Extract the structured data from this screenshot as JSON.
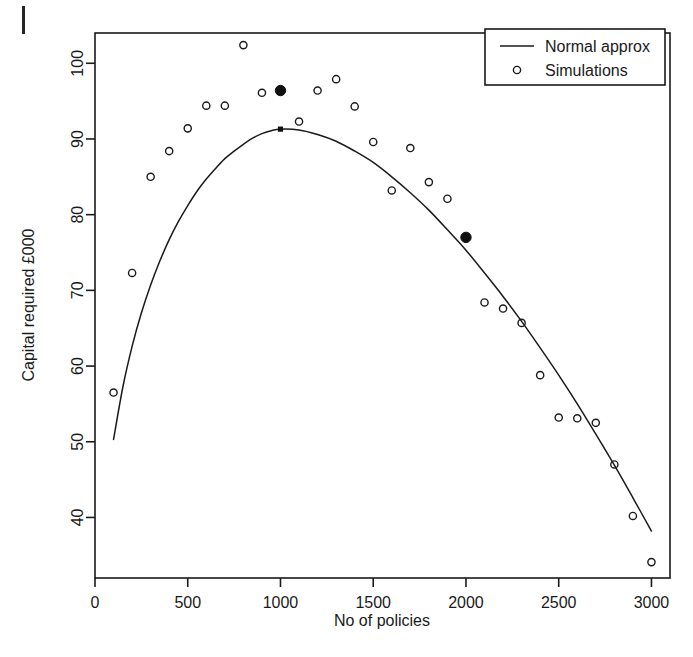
{
  "figure": {
    "background_color": "#ffffff",
    "ink_color": "#1a1a1a",
    "scan_artifact": "vertical-bar-top-left"
  },
  "chart_data": {
    "type": "scatter",
    "title": "",
    "xlabel": "No of policies",
    "ylabel": "Capital required £000",
    "xlim": [
      0,
      3100
    ],
    "ylim": [
      32,
      104
    ],
    "xticks": [
      0,
      500,
      1000,
      1500,
      2000,
      2500,
      3000
    ],
    "xtick_labels": [
      "0",
      "500",
      "1000",
      "1500",
      "2000",
      "2500",
      "3000"
    ],
    "yticks": [
      40,
      50,
      60,
      70,
      80,
      90,
      100
    ],
    "ytick_labels": [
      "40",
      "50",
      "60",
      "70",
      "80",
      "90",
      "100"
    ],
    "grid": false,
    "legend_position": "top-right",
    "legend": [
      {
        "label": "Normal approx",
        "marker": "line"
      },
      {
        "label": "Simulations",
        "marker": "open-circle"
      }
    ],
    "series": [
      {
        "name": "Normal approx",
        "style": "line",
        "x": [
          100,
          150,
          200,
          250,
          300,
          350,
          400,
          450,
          500,
          550,
          600,
          650,
          700,
          750,
          800,
          850,
          900,
          950,
          1000,
          1100,
          1200,
          1300,
          1400,
          1500,
          1600,
          1700,
          1800,
          1900,
          2000,
          2100,
          2200,
          2300,
          2400,
          2500,
          2600,
          2700,
          2800,
          2900,
          3000
        ],
        "y": [
          50.3,
          57.2,
          62.6,
          67.0,
          70.7,
          73.9,
          76.7,
          79.1,
          81.2,
          83.1,
          84.7,
          86.1,
          87.4,
          88.4,
          89.3,
          90.1,
          90.7,
          91.1,
          91.3,
          91.2,
          90.6,
          89.7,
          88.4,
          86.9,
          85.0,
          82.9,
          80.6,
          78.0,
          75.3,
          72.3,
          69.2,
          65.9,
          62.4,
          58.8,
          55.0,
          51.0,
          46.9,
          42.6,
          38.2
        ]
      },
      {
        "name": "Simulations",
        "style": "open-circle",
        "x": [
          100,
          200,
          300,
          400,
          500,
          600,
          700,
          800,
          900,
          1000,
          1100,
          1200,
          1300,
          1400,
          1500,
          1600,
          1700,
          1800,
          1900,
          2000,
          2100,
          2200,
          2300,
          2400,
          2500,
          2600,
          2700,
          2800,
          2900,
          3000
        ],
        "y": [
          56.5,
          72.3,
          85.0,
          88.4,
          91.4,
          94.4,
          94.4,
          102.4,
          96.1,
          96.4,
          92.3,
          96.4,
          97.9,
          94.3,
          89.6,
          83.2,
          88.8,
          84.3,
          82.1,
          77.0,
          68.4,
          67.6,
          65.7,
          58.8,
          53.2,
          53.1,
          52.5,
          47.0,
          40.2,
          34.1
        ]
      },
      {
        "name": "Highlighted simulations",
        "style": "filled-circle",
        "x": [
          1000,
          2000
        ],
        "y": [
          96.4,
          77.0
        ]
      },
      {
        "name": "Curve maximum marker",
        "style": "small-filled-square",
        "x": [
          1000
        ],
        "y": [
          91.3
        ]
      }
    ]
  }
}
